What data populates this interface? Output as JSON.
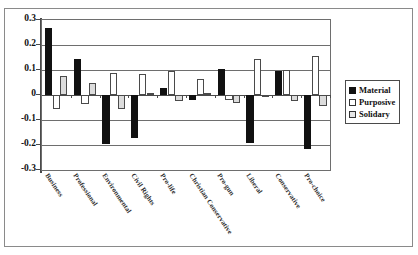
{
  "chart_data": {
    "type": "bar",
    "title": "",
    "subtitle": "",
    "xlabel": "",
    "ylabel": "",
    "ylim": [
      -0.3,
      0.3
    ],
    "ytick_labels": [
      "0.3",
      "0.2",
      "0.1",
      "0",
      "-0.1",
      "-0.2",
      "-0.3"
    ],
    "ytick_values": [
      0.3,
      0.2,
      0.1,
      0,
      -0.1,
      -0.2,
      -0.3
    ],
    "grid": true,
    "legend_position": "right",
    "orientation": "vertical",
    "categories": [
      "Business",
      "Professional",
      "Environmental",
      "Civil Rights",
      "Pro-life",
      "Christian Conservative",
      "Pro-gun",
      "Liberal",
      "Conservative",
      "Pro-choice"
    ],
    "series": [
      {
        "name": "Material",
        "color": "#111111",
        "values": [
          0.27,
          0.145,
          -0.195,
          -0.17,
          0.03,
          -0.02,
          0.105,
          -0.19,
          0.095,
          -0.215
        ]
      },
      {
        "name": "Purposive",
        "color": "#ffffff",
        "values": [
          -0.055,
          -0.035,
          0.09,
          0.085,
          0.095,
          0.065,
          -0.02,
          0.145,
          0.1,
          0.155
        ]
      },
      {
        "name": "Solidary",
        "color": "#dcdcdc",
        "values": [
          0.075,
          0.05,
          -0.055,
          0.008,
          -0.025,
          0.008,
          -0.03,
          -0.005,
          -0.025,
          -0.045
        ]
      }
    ]
  },
  "legend": {
    "items": [
      {
        "label": "Material",
        "swatch": "material-swatch"
      },
      {
        "label": "Purposive",
        "swatch": "purposive-swatch"
      },
      {
        "label": "Solidary",
        "swatch": "solidary-swatch"
      }
    ]
  },
  "colors": {
    "material": "#111111",
    "purposive": "#ffffff",
    "solidary": "#dcdcdc",
    "axis": "#4a4a4a",
    "grid": "#6e6e6e",
    "frame": "#8a8a8a"
  }
}
